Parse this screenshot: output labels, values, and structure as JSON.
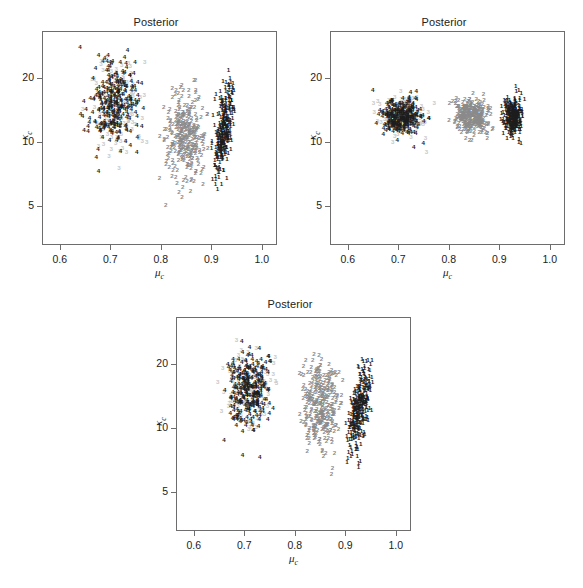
{
  "figure": {
    "panel_count": 3,
    "layout": "two panels on top row, one centered on bottom row"
  },
  "panels": [
    {
      "id": "panel-top-left",
      "title": "Posterior",
      "xlabel": "μ",
      "xlabel_sub": "c",
      "ylabel": "κ",
      "ylabel_sub": "c"
    },
    {
      "id": "panel-top-right",
      "title": "Posterior",
      "xlabel": "μ",
      "xlabel_sub": "c",
      "ylabel": "κ",
      "ylabel_sub": "c"
    },
    {
      "id": "panel-bottom-center",
      "title": "Posterior",
      "xlabel": "μ",
      "xlabel_sub": "c",
      "ylabel": "κ",
      "ylabel_sub": "c"
    }
  ],
  "axes": {
    "x_ticks": [
      "0.6",
      "0.7",
      "0.8",
      "0.9",
      "1.0"
    ],
    "x_tick_values": [
      0.6,
      0.7,
      0.8,
      0.9,
      1.0
    ],
    "x_range": [
      0.565,
      1.03
    ],
    "y_ticks": [
      "5",
      "10",
      "20"
    ],
    "y_tick_values": [
      5,
      10,
      20
    ],
    "y_range": [
      3.3,
      33
    ],
    "y_scale": "log",
    "x_scale": "linear",
    "grid": false,
    "legend": false
  },
  "colors": {
    "marker_dark": "#1c1c1c",
    "marker_gray": "#8a8a8a",
    "marker_light": "#c8c8c8",
    "frame": "#6d6d6d",
    "text": "#222222",
    "background": "#ffffff"
  },
  "chart_data": [
    {
      "type": "scatter",
      "title": "Posterior",
      "xlabel": "mu_c",
      "ylabel": "kappa_c",
      "xlim": [
        0.565,
        1.03
      ],
      "ylim": [
        3.3,
        33
      ],
      "y_scale": "log",
      "grid": false,
      "legend": false,
      "marker_style": "digit glyph of series id",
      "series": [
        {
          "name": "4",
          "glyph": "4",
          "color": "#1c1c1c",
          "n": 300,
          "x_center": 0.705,
          "x_sd": 0.024,
          "y_center": 15.0,
          "y_log_sd": 0.23,
          "x_range": [
            0.635,
            0.765
          ],
          "y_range": [
            6.6,
            29.0
          ]
        },
        {
          "name": "3",
          "glyph": "3",
          "color": "#c8c8c8",
          "n": 120,
          "x_center": 0.71,
          "x_sd": 0.027,
          "y_center": 14.0,
          "y_log_sd": 0.27,
          "x_range": [
            0.638,
            0.772
          ],
          "y_range": [
            4.7,
            28.0
          ]
        },
        {
          "name": "2",
          "glyph": "2",
          "color": "#8a8a8a",
          "n": 300,
          "x_center": 0.848,
          "x_sd": 0.02,
          "y_center": 10.8,
          "y_log_sd": 0.24,
          "x_range": [
            0.795,
            0.895
          ],
          "y_range": [
            4.3,
            21.5
          ]
        },
        {
          "name": "1",
          "glyph": "1",
          "color": "#1c1c1c",
          "n": 300,
          "x_center": 0.923,
          "x_sd": 0.011,
          "y_center": 11.2,
          "y_log_sd": 0.26,
          "x_range": [
            0.897,
            0.948
          ],
          "y_range": [
            4.3,
            22.5
          ],
          "xy_correlation": 0.62
        }
      ]
    },
    {
      "type": "scatter",
      "title": "Posterior",
      "xlabel": "mu_c",
      "ylabel": "kappa_c",
      "xlim": [
        0.565,
        1.03
      ],
      "ylim": [
        3.3,
        33
      ],
      "y_scale": "log",
      "grid": false,
      "legend": false,
      "marker_style": "digit glyph of series id",
      "series": [
        {
          "name": "4",
          "glyph": "4",
          "color": "#1c1c1c",
          "n": 300,
          "x_center": 0.705,
          "x_sd": 0.02,
          "y_center": 13.0,
          "y_log_sd": 0.095,
          "x_range": [
            0.645,
            0.762
          ],
          "y_range": [
            9.2,
            18.3
          ]
        },
        {
          "name": "3",
          "glyph": "3",
          "color": "#c8c8c8",
          "n": 110,
          "x_center": 0.706,
          "x_sd": 0.026,
          "y_center": 12.9,
          "y_log_sd": 0.115,
          "x_range": [
            0.628,
            0.772
          ],
          "y_range": [
            8.6,
            18.6
          ]
        },
        {
          "name": "2",
          "glyph": "2",
          "color": "#8a8a8a",
          "n": 300,
          "x_center": 0.845,
          "x_sd": 0.017,
          "y_center": 13.0,
          "y_log_sd": 0.095,
          "x_range": [
            0.798,
            0.891
          ],
          "y_range": [
            9.0,
            18.2
          ]
        },
        {
          "name": "1",
          "glyph": "1",
          "color": "#1c1c1c",
          "n": 300,
          "x_center": 0.926,
          "x_sd": 0.009,
          "y_center": 13.2,
          "y_log_sd": 0.1,
          "x_range": [
            0.9,
            0.95
          ],
          "y_range": [
            9.2,
            18.5
          ]
        }
      ]
    },
    {
      "type": "scatter",
      "title": "Posterior",
      "xlabel": "mu_c",
      "ylabel": "kappa_c",
      "xlim": [
        0.565,
        1.03
      ],
      "ylim": [
        3.3,
        33
      ],
      "y_scale": "log",
      "grid": false,
      "legend": false,
      "marker_style": "digit glyph of series id",
      "series": [
        {
          "name": "4",
          "glyph": "4",
          "color": "#1c1c1c",
          "n": 300,
          "x_center": 0.706,
          "x_sd": 0.022,
          "y_center": 15.2,
          "y_log_sd": 0.2,
          "x_range": [
            0.648,
            0.76
          ],
          "y_range": [
            7.1,
            27.5
          ]
        },
        {
          "name": "3",
          "glyph": "3",
          "color": "#c8c8c8",
          "n": 120,
          "x_center": 0.708,
          "x_sd": 0.026,
          "y_center": 14.6,
          "y_log_sd": 0.23,
          "x_range": [
            0.642,
            0.768
          ],
          "y_range": [
            6.8,
            27.0
          ]
        },
        {
          "name": "2",
          "glyph": "2",
          "color": "#8a8a8a",
          "n": 300,
          "x_center": 0.848,
          "x_sd": 0.019,
          "y_center": 13.0,
          "y_log_sd": 0.24,
          "x_range": [
            0.798,
            0.895
          ],
          "y_range": [
            5.2,
            22.5
          ]
        },
        {
          "name": "1",
          "glyph": "1",
          "color": "#1c1c1c",
          "n": 300,
          "x_center": 0.925,
          "x_sd": 0.012,
          "y_center": 12.4,
          "y_log_sd": 0.25,
          "x_range": [
            0.897,
            0.952
          ],
          "y_range": [
            5.0,
            22.0
          ],
          "xy_correlation": 0.6
        }
      ]
    }
  ]
}
